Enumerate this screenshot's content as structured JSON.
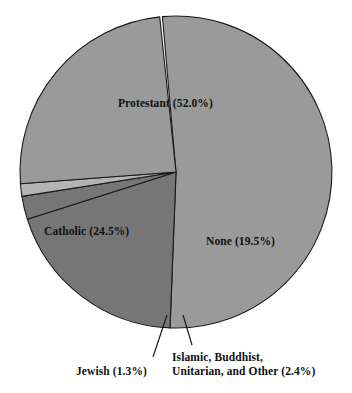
{
  "chart_data": {
    "type": "pie",
    "title": "",
    "subtitle": "",
    "xlabel": "",
    "ylabel": "",
    "legend_position": "none",
    "grid": false,
    "units": "percent",
    "total": 99.7,
    "categories": [
      "Protestant",
      "Catholic",
      "None",
      "Islamic, Buddhist, Unitarian, and Other",
      "Jewish"
    ],
    "values": [
      52.0,
      24.5,
      19.5,
      2.4,
      1.3
    ],
    "slices": [
      {
        "name": "Protestant",
        "label": "Protestant (52.0%)",
        "value": 52.0,
        "value_text": "52.0%",
        "color": "#9a9a9a",
        "start_angle": 265.0,
        "end_angle": 452.2,
        "label_placement": "inside",
        "callout": false
      },
      {
        "name": "None",
        "label": "None (19.5%)",
        "value": 19.5,
        "value_text": "19.5%",
        "color": "#767676",
        "start_angle": 452.2,
        "end_angle": 522.4,
        "label_placement": "inside",
        "callout": false
      },
      {
        "name": "Islamic, Buddhist, Unitarian, and Other",
        "label_line1": "Islamic, Buddhist,",
        "label_line2": "Unitarian, and Other (2.4%)",
        "value": 2.4,
        "value_text": "2.4%",
        "color": "#767676",
        "start_angle": 522.4,
        "end_angle": 531.0,
        "label_placement": "callout-below",
        "callout": true
      },
      {
        "name": "Jewish",
        "label": "Jewish (1.3%)",
        "value": 1.3,
        "value_text": "1.3%",
        "color": "#b4b4b4",
        "start_angle": 531.0,
        "end_angle": 535.7,
        "label_placement": "callout-below",
        "callout": true
      },
      {
        "name": "Catholic",
        "label": "Catholic (24.5%)",
        "value": 24.5,
        "value_text": "24.5%",
        "color": "#9a9a9a",
        "start_angle": 535.7,
        "end_angle": 624.0,
        "label_placement": "inside",
        "callout": false
      }
    ],
    "geometry": {
      "center_x": 176,
      "center_y": 172,
      "radius": 156,
      "stroke_color": "#1a1a1a",
      "stroke_width": 1.1,
      "background": "#ffffff"
    },
    "colors": {
      "protestant": "#9a9a9a",
      "catholic": "#9a9a9a",
      "none": "#767676",
      "other": "#767676",
      "jewish": "#b4b4b4",
      "outline": "#1a1a1a",
      "text": "#101010",
      "background": "#ffffff"
    },
    "leader_lines": [
      {
        "for": "Jewish",
        "x1": 167,
        "y1": 315,
        "x2": 153,
        "y2": 357
      },
      {
        "for": "Islamic, Buddhist, Unitarian, and Other",
        "x1": 183,
        "y1": 315,
        "x2": 192,
        "y2": 345
      }
    ]
  }
}
